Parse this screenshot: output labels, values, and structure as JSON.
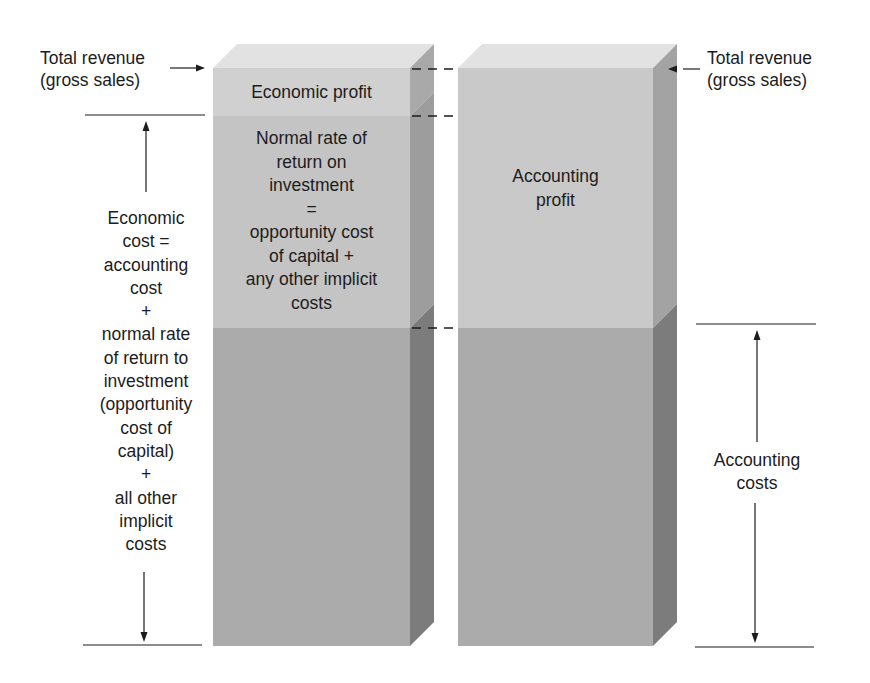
{
  "diagram": {
    "colors": {
      "top_face": "#e2e2e2",
      "profit_front": "#cdcdcd",
      "normal_return_front": "#c6c6c6",
      "cost_front": "#acacac",
      "side_light": "#9d9d9d",
      "side_dark": "#7c7c7c",
      "line": "#1c1c1c"
    },
    "left_block": {
      "name": "Economic view",
      "sections": [
        {
          "id": "economic-profit",
          "lines": [
            "Economic profit"
          ]
        },
        {
          "id": "normal-return",
          "lines": [
            "Normal rate of",
            "return on",
            "investment",
            "=",
            "opportunity cost",
            "of capital +",
            "any other implicit",
            "costs"
          ]
        },
        {
          "id": "accounting-costs-left",
          "lines": []
        }
      ]
    },
    "right_block": {
      "name": "Accounting view",
      "sections": [
        {
          "id": "accounting-profit",
          "lines": [
            "Accounting",
            "profit"
          ]
        },
        {
          "id": "accounting-costs-right",
          "lines": []
        }
      ]
    },
    "annotations": {
      "total_revenue_left": [
        "Total revenue",
        "(gross sales)"
      ],
      "total_revenue_right": [
        "Total revenue",
        "(gross sales)"
      ],
      "economic_cost": [
        "Economic",
        "cost =",
        "accounting",
        "cost",
        "+",
        "normal rate",
        "of return to",
        "investment",
        "(opportunity",
        "cost of",
        "capital)",
        "+",
        "all other",
        "implicit",
        "costs"
      ],
      "accounting_costs": [
        "Accounting",
        "costs"
      ]
    }
  }
}
